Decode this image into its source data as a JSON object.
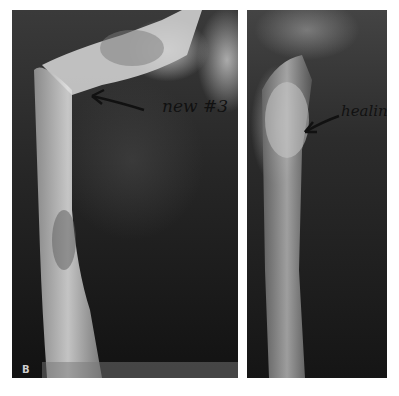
{
  "figure": {
    "panels": [
      {
        "id": "left",
        "panel_letter": "B",
        "annotation": "new #3",
        "subject": "humerus radiograph with new fracture"
      },
      {
        "id": "right",
        "annotation": "healing",
        "subject": "humerus radiograph showing healing"
      }
    ],
    "colors": {
      "background": "#ffffff",
      "film_dark": "#161616",
      "bone_light": "#d9d9d9",
      "annotation_ink": "#111111"
    }
  }
}
